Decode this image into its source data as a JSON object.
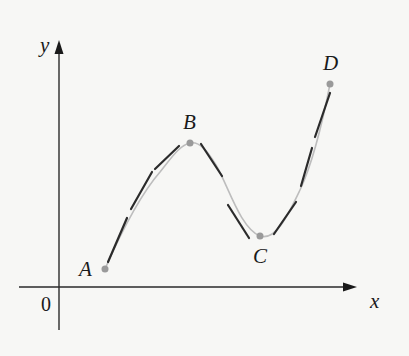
{
  "figure": {
    "axes": {
      "x_label": "x",
      "y_label": "y",
      "origin_label": "0"
    },
    "points": [
      {
        "label": "A",
        "px": [
          105,
          269
        ]
      },
      {
        "label": "B",
        "px": [
          190,
          143
        ]
      },
      {
        "label": "C",
        "px": [
          260,
          236
        ]
      },
      {
        "label": "D",
        "px": [
          330,
          84
        ]
      }
    ],
    "colors": {
      "background": "#f7f7f5",
      "axis": "#2a2a2a",
      "curve": "#bdbdbd",
      "segments": "#2b2b2b",
      "points": "#9a9a9a"
    }
  }
}
